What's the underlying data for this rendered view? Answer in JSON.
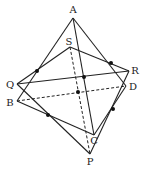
{
  "diagram": {
    "points": {
      "A": {
        "label": "A",
        "x": 73,
        "y": 18,
        "lx": 73,
        "ly": 13
      },
      "S": {
        "label": "S",
        "x": 70,
        "y": 47,
        "lx": 69,
        "ly": 45
      },
      "R": {
        "label": "R",
        "x": 129,
        "y": 71,
        "lx": 135,
        "ly": 73
      },
      "D": {
        "label": "D",
        "x": 126,
        "y": 86,
        "lx": 133,
        "ly": 90
      },
      "Q": {
        "label": "Q",
        "x": 17,
        "y": 84,
        "lx": 10,
        "ly": 87
      },
      "B": {
        "label": "B",
        "x": 17,
        "y": 101,
        "lx": 10,
        "ly": 105
      },
      "C": {
        "label": "C",
        "x": 94,
        "y": 135,
        "lx": 93,
        "ly": 144
      },
      "P": {
        "label": "P",
        "x": 90,
        "y": 154,
        "lx": 90,
        "ly": 165
      }
    },
    "dots": [
      {
        "x": 37,
        "y": 71
      },
      {
        "x": 111,
        "y": 62
      },
      {
        "x": 84,
        "y": 77
      },
      {
        "x": 78,
        "y": 92
      },
      {
        "x": 48,
        "y": 115
      },
      {
        "x": 113,
        "y": 109
      }
    ]
  }
}
